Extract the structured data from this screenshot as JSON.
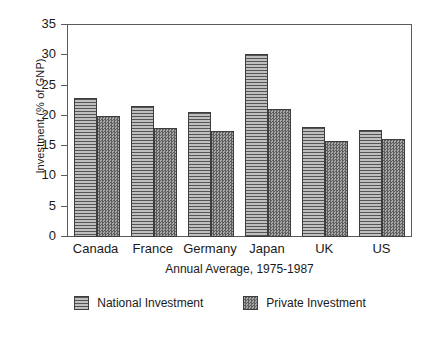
{
  "chart_data": {
    "type": "bar",
    "title": "",
    "xlabel": "Annual Average, 1975-1987",
    "ylabel": "Investment (% of GNP)",
    "categories": [
      "Canada",
      "France",
      "Germany",
      "Japan",
      "UK",
      "US"
    ],
    "series": [
      {
        "name": "National Investment",
        "values": [
          23.0,
          21.6,
          20.6,
          30.2,
          18.2,
          17.7
        ]
      },
      {
        "name": "Private Investment",
        "values": [
          20.0,
          18.0,
          17.5,
          21.2,
          15.8,
          16.2
        ]
      }
    ],
    "ylim": [
      0,
      35
    ],
    "yticks": [
      0,
      5,
      10,
      15,
      20,
      25,
      30,
      35
    ],
    "ytick_labels": [
      "0",
      "5",
      "10",
      "15",
      "20",
      "25",
      "30",
      "35"
    ],
    "grid": false,
    "legend_position": "bottom",
    "colors": {
      "national_fill": "#bfbfbf",
      "national_hatch": "#555555",
      "private_fill": "#8a8a8a",
      "private_hatch": "#5e5e5e",
      "axis": "#5a5a5a",
      "bar_outline": "#3d3d3d",
      "background": "#ffffff",
      "text": "#1a1a1a"
    }
  }
}
